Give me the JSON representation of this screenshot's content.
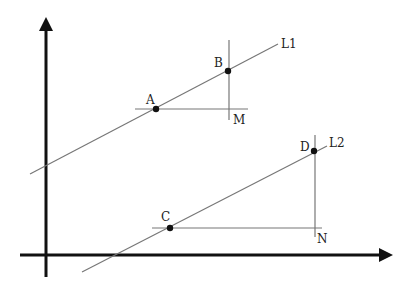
{
  "diagram": {
    "type": "coordinate-geometry",
    "axes": {
      "x_axis": "horizontal arrow",
      "y_axis": "vertical arrow"
    },
    "lines": [
      {
        "name": "L1",
        "label": "L1"
      },
      {
        "name": "L2",
        "label": "L2"
      }
    ],
    "points": {
      "A": {
        "label": "A",
        "on": "L1"
      },
      "B": {
        "label": "B",
        "on": "L1"
      },
      "M": {
        "label": "M",
        "role": "right-angle corner"
      },
      "C": {
        "label": "C",
        "on": "L2"
      },
      "D": {
        "label": "D",
        "on": "L2"
      },
      "N": {
        "label": "N",
        "role": "right-angle corner"
      }
    },
    "colors": {
      "axis": "#111111",
      "lines": "#777777",
      "text": "#222222"
    }
  }
}
